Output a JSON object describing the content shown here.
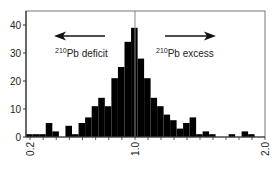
{
  "chart_data": {
    "type": "bar",
    "title": "",
    "xlabel": "",
    "ylabel": "",
    "xlim": [
      0.17,
      2.0
    ],
    "ylim": [
      0,
      44
    ],
    "bin_width": 0.05,
    "bin_starts": [
      0.17,
      0.22,
      0.27,
      0.32,
      0.37,
      0.42,
      0.47,
      0.52,
      0.57,
      0.62,
      0.67,
      0.72,
      0.77,
      0.82,
      0.87,
      0.92,
      0.97,
      1.02,
      1.07,
      1.12,
      1.17,
      1.22,
      1.27,
      1.32,
      1.37,
      1.42,
      1.47,
      1.52,
      1.57,
      1.62,
      1.67,
      1.72,
      1.77,
      1.82,
      1.87
    ],
    "values": [
      1,
      1,
      1,
      5,
      2,
      0,
      4,
      1,
      5,
      7,
      11,
      14,
      11,
      21,
      25,
      34,
      39,
      28,
      21,
      14,
      11,
      8,
      6,
      3,
      5,
      7,
      1,
      2,
      1,
      0,
      0,
      1,
      0,
      2,
      1
    ],
    "yticks": [
      0,
      10,
      20,
      30,
      40
    ],
    "xtick_labels": [
      {
        "value": 0.2,
        "label": "0.2"
      },
      {
        "value": 1.0,
        "label": "1.0"
      },
      {
        "value": 2.0,
        "label": "2.0"
      }
    ],
    "xminor_ticks_step": 0.1,
    "reference_line": 1.0,
    "annotations": [
      {
        "text_sup": "210",
        "text": "Pb deficit",
        "arrow": "left"
      },
      {
        "text_sup": "210",
        "text": "Pb excess",
        "arrow": "right"
      }
    ],
    "colors": {
      "bars": "#000000",
      "axis": "#333333",
      "reference_line": "#888888"
    }
  }
}
